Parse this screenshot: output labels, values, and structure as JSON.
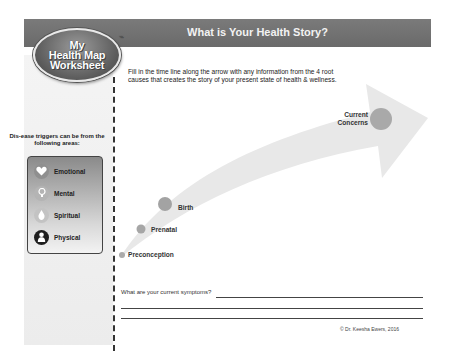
{
  "logo": {
    "line1": "My",
    "line2": "Health Map",
    "line3": "Worksheet",
    "trademark": "™"
  },
  "header": {
    "title": "What is Your Health Story?"
  },
  "instructions": "Fill in the time line along the arrow with any information from the 4 root causes that creates the story of your present state of health & wellness.",
  "sidebar": {
    "triggers_label": "Dis-ease triggers can be from the following areas:",
    "items": [
      {
        "label": "Emotional",
        "icon": "heart-icon"
      },
      {
        "label": "Mental",
        "icon": "lightbulb-icon"
      },
      {
        "label": "Spiritual",
        "icon": "flame-icon"
      },
      {
        "label": "Physical",
        "icon": "person-icon"
      }
    ]
  },
  "timeline": {
    "milestones": [
      {
        "label": "Preconception"
      },
      {
        "label": "Prenatal"
      },
      {
        "label": "Birth"
      },
      {
        "label": "Current Concerns"
      }
    ]
  },
  "symptoms": {
    "question": "What are your current symptoms?"
  },
  "copyright": "© Dr. Keesha Ewers, 2016",
  "colors": {
    "header_bar": "#6f6f6f",
    "arrow": "#e6e6e6",
    "milestone_dot": "#a8a8a8"
  }
}
